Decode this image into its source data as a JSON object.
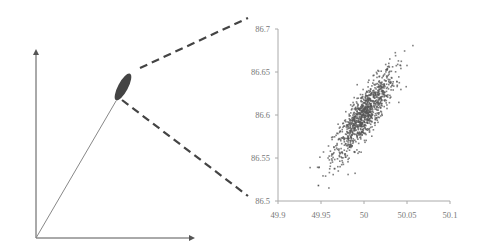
{
  "diagram": {
    "left_axes": {
      "origin": [
        36,
        238
      ],
      "x_end": [
        192,
        238
      ],
      "y_end": [
        36,
        52
      ],
      "color": "#555555"
    },
    "vector": {
      "from": [
        36,
        238
      ],
      "to": [
        116,
        101
      ],
      "color": "#777777"
    },
    "ellipse": {
      "center": [
        123,
        87
      ],
      "rx": 15,
      "ry": 5,
      "rotation_deg": -62,
      "fill": "#444444"
    },
    "zoom_lines": {
      "upper": {
        "from": [
          140,
          68
        ],
        "to": [
          248,
          18
        ]
      },
      "lower": {
        "from": [
          122,
          100
        ],
        "to": [
          248,
          196
        ]
      },
      "color": "#444444"
    }
  },
  "chart_data": {
    "type": "scatter",
    "title": "",
    "xlabel": "",
    "ylabel": "",
    "xlim": [
      49.9,
      50.1
    ],
    "ylim": [
      86.5,
      86.7
    ],
    "x_ticks": [
      "49.9",
      "49.95",
      "50",
      "50.05",
      "50.1"
    ],
    "y_ticks": [
      "86.7",
      "86.65",
      "86.6",
      "86.55",
      "86.5"
    ],
    "grid": false,
    "legend": null,
    "point_color": "#555555",
    "distribution": {
      "n_points": 1000,
      "mean": [
        50.0,
        86.6
      ],
      "std": [
        0.018,
        0.026
      ],
      "correlation": 0.85,
      "description": "Bivariate normal cloud, positively correlated, tilted along diagonal; outlier near (49.947, 86.518)"
    }
  },
  "plot_area": {
    "left": 278,
    "right": 450,
    "top": 29,
    "bottom": 201
  }
}
